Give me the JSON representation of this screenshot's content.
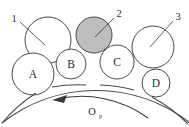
{
  "figure": {
    "background_color": "#ffffff",
    "outline_color": "#4a4a4a",
    "shaded_fill": "#bdbdbd",
    "text_color": "#2e2e2e"
  },
  "callouts": [
    {
      "id": "callout-1",
      "label": "1",
      "label_x": 15,
      "label_y": 20,
      "line_x1": 20,
      "line_y1": 22,
      "line_x2": 45,
      "line_y2": 45
    },
    {
      "id": "callout-2",
      "label": "2",
      "label_x": 117,
      "label_y": 16,
      "line_x1": 114,
      "line_y1": 18,
      "line_x2": 95,
      "line_y2": 37
    },
    {
      "id": "callout-3",
      "label": "3",
      "label_x": 176,
      "label_y": 19,
      "line_x1": 173,
      "line_y1": 21,
      "line_x2": 150,
      "line_y2": 47
    }
  ],
  "grains": [
    {
      "id": "grain-1",
      "label": "",
      "cx": 48,
      "cy": 40,
      "r": 23,
      "shaded": false
    },
    {
      "id": "grain-2",
      "label": "",
      "cx": 94,
      "cy": 35,
      "r": 18,
      "shaded": true
    },
    {
      "id": "grain-3",
      "label": "",
      "cx": 153,
      "cy": 47,
      "r": 21,
      "shaded": false
    },
    {
      "id": "grain-A",
      "label": "A",
      "cx": 33,
      "cy": 74,
      "r": 21,
      "shaded": false
    },
    {
      "id": "grain-B",
      "label": "B",
      "cx": 71,
      "cy": 64,
      "r": 15,
      "shaded": false
    },
    {
      "id": "grain-C",
      "label": "C",
      "cx": 117,
      "cy": 62,
      "r": 17,
      "shaded": false
    },
    {
      "id": "grain-D",
      "label": "D",
      "cx": 156,
      "cy": 83,
      "r": 14,
      "shaded": false
    }
  ],
  "wheel": {
    "name": "wheel-surface-arc",
    "center_x": 96,
    "center_y": 236,
    "radius": 152
  },
  "rotation": {
    "symbol": "O",
    "subscript": "p",
    "symbol_x": 91,
    "symbol_y": 114,
    "direction": "counter-clockwise",
    "arrow_center_x": 96,
    "arrow_center_y": 212,
    "arrow_radius": 113
  }
}
